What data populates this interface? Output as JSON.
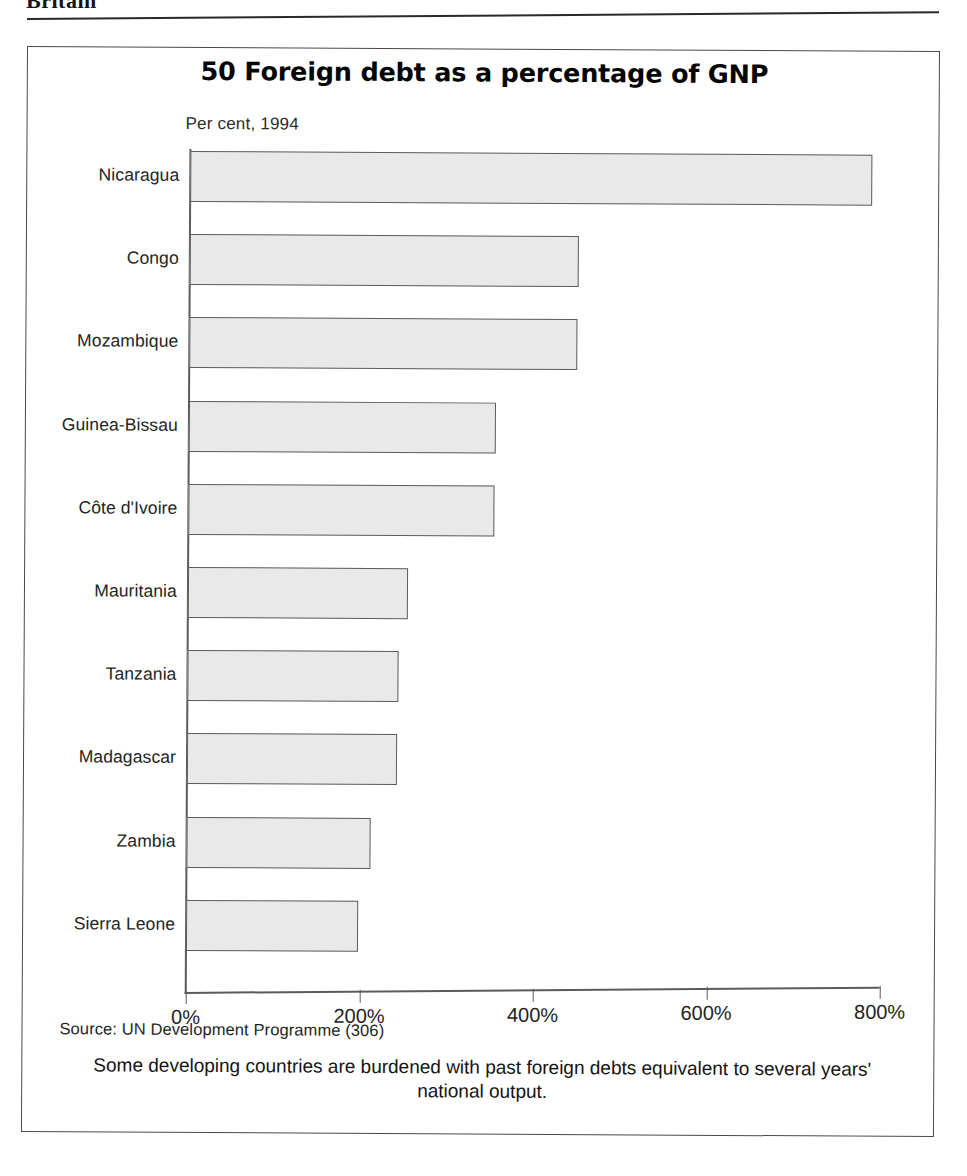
{
  "page": {
    "header_text": "Britain",
    "header_rule": "horizontal-rule"
  },
  "figure": {
    "title": "50 Foreign debt as a percentage of GNP",
    "subtitle": "Per cent, 1994",
    "source": "Source: UN Development Programme (306)",
    "caption": "Some developing countries are burdened with past foreign debts equivalent to several years' national output.",
    "colors": {
      "bar_fill": "#e9e9e9",
      "bar_border": "#5d5d5d",
      "axis": "#5b5b5b",
      "frame": "#4a4a4a",
      "text": "#1a1a1a"
    }
  },
  "chart_data": {
    "type": "bar",
    "orientation": "horizontal",
    "title": "50 Foreign debt as a percentage of GNP",
    "subtitle": "Per cent, 1994",
    "xlabel": "",
    "ylabel": "",
    "xlim": [
      0,
      800
    ],
    "xticks": [
      0,
      200,
      400,
      600,
      800
    ],
    "xtick_labels": [
      "0%",
      "200%",
      "400%",
      "600%",
      "800%"
    ],
    "grid": false,
    "legend": false,
    "categories": [
      "Nicaragua",
      "Congo",
      "Mozambique",
      "Guinea-Bissau",
      "Côte d'Ivoire",
      "Mauritania",
      "Tanzania",
      "Madagascar",
      "Zambia",
      "Sierra Leone"
    ],
    "values": [
      786,
      448,
      447,
      354,
      353,
      254,
      243,
      242,
      212,
      198
    ],
    "units": "percent of GNP",
    "source": "UN Development Programme (306)",
    "annotation": "Some developing countries are burdened with past foreign debts equivalent to several years' national output."
  }
}
